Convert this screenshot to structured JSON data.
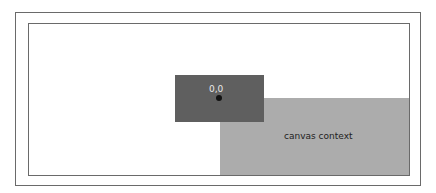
{
  "canvas": {
    "origin_label": "0,0",
    "context_label": "canvas context",
    "colors": {
      "origin_box": "#5f5f5f",
      "context_box": "#acacac",
      "border": "#6a6a6a"
    }
  }
}
